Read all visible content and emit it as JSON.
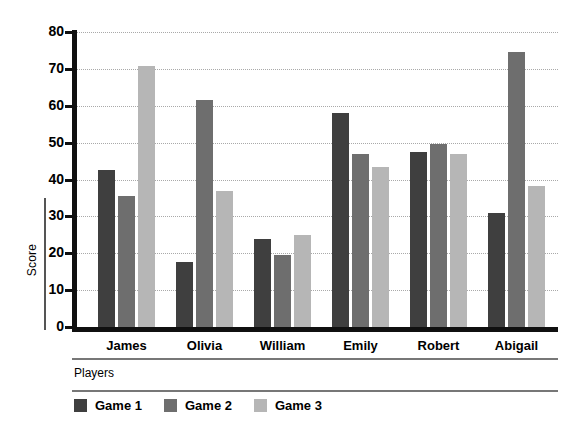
{
  "chart_data": {
    "type": "bar",
    "title": "",
    "xlabel": "Players",
    "ylabel": "Score",
    "categories": [
      "James",
      "Olivia",
      "William",
      "Emily",
      "Robert",
      "Abigail"
    ],
    "series": [
      {
        "name": "Game 1",
        "color": "#3f3f3f",
        "values": [
          42.5,
          17.5,
          24.0,
          58.0,
          47.5,
          31.0
        ]
      },
      {
        "name": "Game 2",
        "color": "#6e6e6e",
        "values": [
          35.5,
          61.5,
          19.5,
          47.0,
          49.5,
          74.5
        ]
      },
      {
        "name": "Game 3",
        "color": "#b6b6b6",
        "values": [
          70.8,
          37.0,
          25.0,
          43.5,
          47.0,
          38.2
        ]
      }
    ],
    "ylim": [
      0,
      80
    ],
    "yticks": [
      0,
      10,
      20,
      30,
      40,
      50,
      60,
      70,
      80
    ],
    "ytick_labels": [
      "0",
      "10",
      "20",
      "30",
      "40",
      "50",
      "60",
      "70",
      "80"
    ],
    "grid": true,
    "grid_style": "dotted",
    "grid_axis": "y",
    "legend": {
      "position": "below",
      "entries": [
        "Game 1",
        "Game 2",
        "Game 3"
      ]
    }
  },
  "colors": {
    "background": "#ffffff",
    "axis": "#101010",
    "grid": "#a9a9a9",
    "rule": "#777777",
    "text": "#000000"
  }
}
